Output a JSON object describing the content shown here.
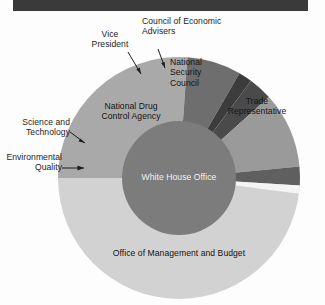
{
  "figure": {
    "type": "pie",
    "background_color": "#fdfdfd",
    "top_bar_color": "#3a3a3a",
    "center": {
      "x": 179,
      "y": 178
    },
    "outer_radius": 121,
    "inner_radius": 57
  },
  "chart_data": {
    "type": "pie",
    "title": "",
    "xlabel": "",
    "ylabel": "",
    "legend_position": "none",
    "grid": false,
    "start_angle_deg": -90,
    "direction": "counterclockwise",
    "categories": [
      "White House Office",
      "Office of Management and Budget",
      "Trade Representative",
      "National Security Council",
      "Council of Economic Advisers",
      "Vice President",
      "National Drug Control Agency",
      "Science and Technology",
      "Environmental Quality"
    ],
    "values": [
      30,
      33.5,
      17,
      7.5,
      2.0,
      3.5,
      11.5,
      2.8,
      1.2
    ],
    "slices": [
      {
        "label": "White House Office",
        "value": 30,
        "color": "#7c7c7c",
        "ring": "inner",
        "label_placement": "inside",
        "label_color": "#f2f2f2"
      },
      {
        "label": "Office of Management and Budget",
        "value": 33.5,
        "color": "#d2d2d2",
        "ring": "outer",
        "start_deg": 180,
        "end_deg": 360,
        "label_placement": "inside",
        "label_color": "#141414"
      },
      {
        "label": "Trade Representative",
        "value": 17,
        "color": "#a9a9a9",
        "ring": "outer",
        "start_deg": 86,
        "end_deg": 180,
        "label_placement": "inside",
        "label_color": "#141414"
      },
      {
        "label": "National Security Council",
        "value": 7.5,
        "color": "#6e6e6e",
        "ring": "outer",
        "start_deg": 60,
        "end_deg": 86,
        "label_placement": "inside",
        "label_color": "#141414"
      },
      {
        "label": "Council of Economic Advisers",
        "value": 2.0,
        "color": "#3c3c3c",
        "ring": "outer",
        "start_deg": 53.5,
        "end_deg": 60,
        "label_placement": "callout",
        "label_color": "#1c1c1c"
      },
      {
        "label": "Vice President",
        "value": 3.5,
        "color": "#4a4a4a",
        "ring": "outer",
        "start_deg": 42,
        "end_deg": 53.5,
        "label_placement": "callout",
        "label_color": "#1c1c1c"
      },
      {
        "label": "National Drug Control Agency",
        "value": 11.5,
        "color": "#9a9a9a",
        "ring": "outer",
        "start_deg": 5.5,
        "end_deg": 42,
        "label_placement": "inside",
        "label_color": "#141414"
      },
      {
        "label": "Science and Technology",
        "value": 2.8,
        "color": "#5f5f5f",
        "ring": "outer",
        "start_deg": -3.5,
        "end_deg": 5.5,
        "label_placement": "callout",
        "label_color": "#1c1c1c"
      },
      {
        "label": "Environmental Quality",
        "value": 1.2,
        "color": "#f4f4f4",
        "ring": "outer",
        "start_deg": -7.5,
        "end_deg": -3.5,
        "label_placement": "callout",
        "label_color": "#1c1c1c"
      }
    ]
  },
  "labels": {
    "vice_president": "Vice\nPresident",
    "council_economic_advisers": "Council of Economic\nAdvisers",
    "national_security_council": "National\nSecurity\nCouncil",
    "trade_representative": "Trade\nRepresentative",
    "national_drug_control_agency": "National Drug\nControl Agency",
    "science_and_technology": "Science and\nTechnology",
    "environmental_quality": "Environmental\nQuality",
    "white_house_office": "White House Office",
    "office_of_management_and_budget": "Office of Management and Budget"
  }
}
